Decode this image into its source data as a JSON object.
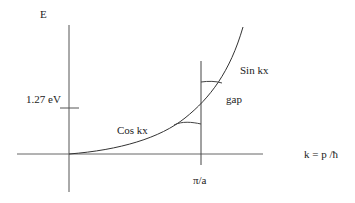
{
  "diagram": {
    "type": "band-structure-energy-vs-wavevector",
    "axes": {
      "y_label": "E",
      "x_label": "k = p /ħ",
      "x_tick_label": "π/a",
      "y_tick_label": "1.27 eV"
    },
    "curve_labels": {
      "lower_branch": "Cos kx",
      "upper_branch": "Sin kx",
      "gap": "gap"
    },
    "colors": {
      "line": "#333333",
      "axis": "#555555",
      "text": "#222222",
      "background": "#ffffff"
    }
  }
}
